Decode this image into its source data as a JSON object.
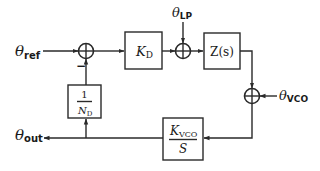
{
  "diagram": {
    "type": "block-diagram",
    "colors": {
      "line": "#2a2a2a",
      "text": "#1a1a1a",
      "background": "#ffffff"
    },
    "inputs": {
      "theta_ref": {
        "symbol": "θ",
        "sub": "ref"
      },
      "theta_lp": {
        "symbol": "θ",
        "sub": "LP"
      },
      "theta_vco": {
        "symbol": "θ",
        "sub": "VCO"
      }
    },
    "outputs": {
      "theta_out": {
        "symbol": "θ",
        "sub": "out"
      }
    },
    "blocks": {
      "kd": {
        "main": "K",
        "sub": "D"
      },
      "zs": {
        "label": "Z(s)"
      },
      "kvco": {
        "num_main": "K",
        "num_sub": "VCO",
        "den": "S"
      },
      "divider": {
        "num": "1",
        "den_main": "N",
        "den_sub": "D"
      }
    },
    "summing_junctions": [
      {
        "id": "sum-phase-detector",
        "minus_sign": "−"
      },
      {
        "id": "sum-loop-filter-noise"
      },
      {
        "id": "sum-vco-noise"
      }
    ],
    "connections": [
      [
        "theta_ref",
        "sum-phase-detector"
      ],
      [
        "sum-phase-detector",
        "kd"
      ],
      [
        "kd",
        "sum-loop-filter-noise"
      ],
      [
        "theta_lp",
        "sum-loop-filter-noise"
      ],
      [
        "sum-loop-filter-noise",
        "zs"
      ],
      [
        "zs",
        "sum-vco-noise"
      ],
      [
        "theta_vco",
        "sum-vco-noise"
      ],
      [
        "sum-vco-noise",
        "kvco"
      ],
      [
        "kvco",
        "theta_out"
      ],
      [
        "kvco",
        "divider"
      ],
      [
        "divider",
        "sum-phase-detector"
      ]
    ]
  }
}
